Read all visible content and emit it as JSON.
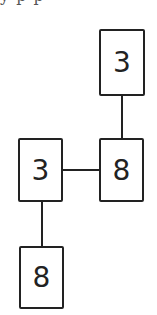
{
  "header": {
    "clipped_text": "y p p"
  },
  "diagram": {
    "nodes": [
      {
        "id": "top",
        "label": "3",
        "x": 99,
        "y": 29,
        "w": 46,
        "h": 67
      },
      {
        "id": "middle-right",
        "label": "8",
        "x": 99,
        "y": 138,
        "w": 45,
        "h": 64
      },
      {
        "id": "middle-left",
        "label": "3",
        "x": 18,
        "y": 138,
        "w": 45,
        "h": 64
      },
      {
        "id": "bottom",
        "label": "8",
        "x": 19,
        "y": 246,
        "w": 45,
        "h": 63
      }
    ],
    "edges": [
      {
        "from": "top",
        "to": "middle-right"
      },
      {
        "from": "middle-left",
        "to": "middle-right"
      },
      {
        "from": "middle-left",
        "to": "bottom"
      }
    ],
    "colors": {
      "stroke": "#222222",
      "background": "#ffffff"
    }
  }
}
